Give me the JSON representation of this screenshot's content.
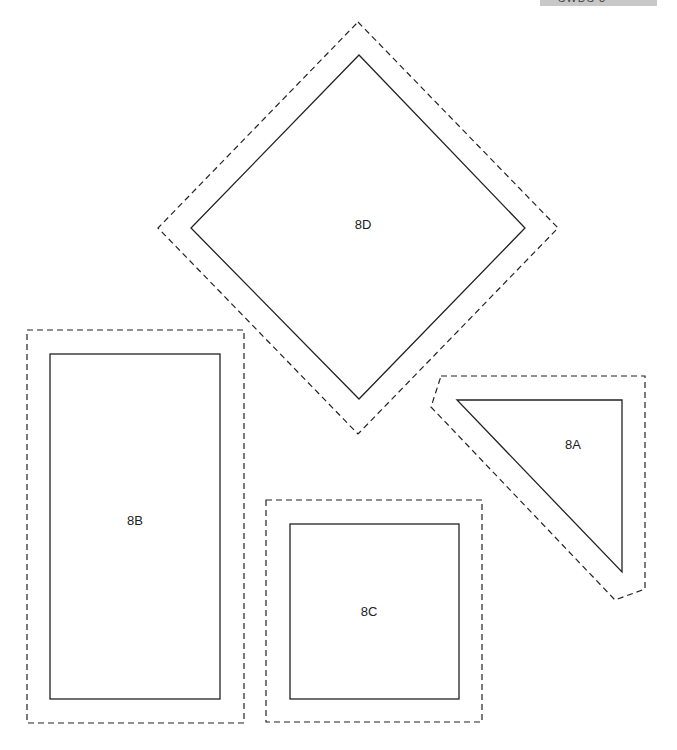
{
  "header": {
    "clipped_text": "SWDS 3"
  },
  "pieces": [
    {
      "id": "8D",
      "label": "8D",
      "shape": "diamond"
    },
    {
      "id": "8B",
      "label": "8B",
      "shape": "rectangle"
    },
    {
      "id": "8A",
      "label": "8A",
      "shape": "triangle"
    },
    {
      "id": "8C",
      "label": "8C",
      "shape": "square"
    }
  ],
  "legend": {
    "solid_line": "sewing line",
    "dashed_line": "cutting line"
  },
  "colors": {
    "line": "#222222",
    "background": "#ffffff",
    "header_bar": "#c8c8c8"
  }
}
